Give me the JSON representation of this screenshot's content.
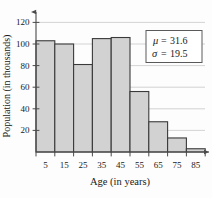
{
  "chart_data": {
    "type": "bar",
    "title": "",
    "subtitle": "",
    "xlabel": "Age (in years)",
    "ylabel": "Population (in thousands)",
    "categories": [
      "5",
      "15",
      "25",
      "35",
      "45",
      "55",
      "65",
      "75",
      "85"
    ],
    "bin_edges": [
      0,
      10,
      20,
      30,
      40,
      50,
      60,
      70,
      80,
      90
    ],
    "values": [
      103,
      100,
      81,
      105,
      106,
      56,
      28,
      13,
      3
    ],
    "xlim": [
      0,
      90
    ],
    "ylim": [
      0,
      125
    ],
    "ytick_labels": [
      "20",
      "40",
      "60",
      "80",
      "100",
      "120"
    ],
    "ytick_values": [
      20,
      40,
      60,
      80,
      100,
      120
    ],
    "xtick_labels": [
      "5",
      "15",
      "25",
      "35",
      "45",
      "55",
      "65",
      "75",
      "85"
    ],
    "grid": true,
    "grid_axis": "y",
    "legend": "none",
    "bar_fill": "#d2d2d2",
    "bar_stroke": "#3a3a3a",
    "axis_color": "#4a4a4a",
    "grid_color": "#c8c8c8",
    "annotations": {
      "stats_box": {
        "mean_symbol": "μ",
        "mean_equals": "=",
        "mean_value": "31.6",
        "sd_symbol": "σ",
        "sd_equals": "=",
        "sd_value": "19.5"
      }
    }
  }
}
